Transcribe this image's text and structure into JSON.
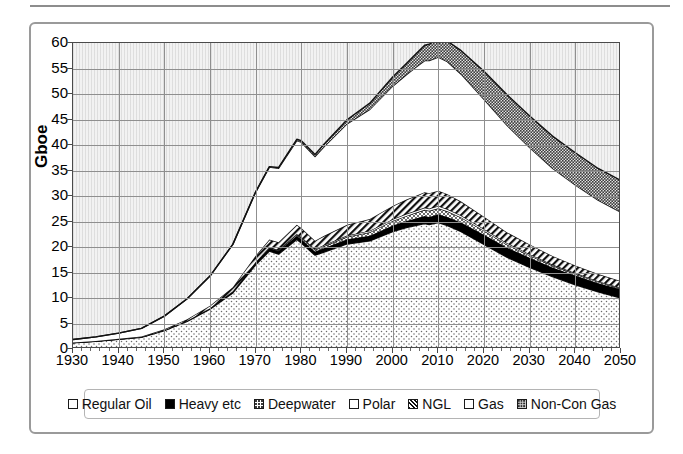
{
  "chart_data": {
    "type": "area",
    "title": "",
    "subtitle": "",
    "xlabel": "",
    "ylabel": "Gboe",
    "xlim": [
      1930,
      2050
    ],
    "ylim": [
      0,
      60
    ],
    "ytick_values": [
      0,
      5,
      10,
      15,
      20,
      25,
      30,
      35,
      40,
      45,
      50,
      55,
      60
    ],
    "xtick_values": [
      1930,
      1940,
      1950,
      1960,
      1970,
      1980,
      1990,
      2000,
      2010,
      2020,
      2030,
      2040,
      2050
    ],
    "grid": true,
    "stacked": true,
    "legend_position": "bottom",
    "x": [
      1930,
      1935,
      1940,
      1945,
      1950,
      1955,
      1960,
      1965,
      1970,
      1973,
      1975,
      1979,
      1980,
      1983,
      1985,
      1990,
      1995,
      2000,
      2003,
      2005,
      2007,
      2008,
      2010,
      2012,
      2015,
      2020,
      2025,
      2030,
      2035,
      2040,
      2045,
      2050
    ],
    "series": [
      {
        "name": "Regular Oil",
        "pattern": "light-stipple",
        "values": [
          1.2,
          1.5,
          1.9,
          2.3,
          3.6,
          5.4,
          7.8,
          11.0,
          16.5,
          19.2,
          18.6,
          21.5,
          20.8,
          18.4,
          19.0,
          20.6,
          21.2,
          23.0,
          23.8,
          24.2,
          24.6,
          24.4,
          24.8,
          24.2,
          23.0,
          20.5,
          18.0,
          16.0,
          14.2,
          12.6,
          11.2,
          10.0
        ]
      },
      {
        "name": "Heavy etc",
        "pattern": "solid-black",
        "values": [
          0.05,
          0.05,
          0.06,
          0.07,
          0.1,
          0.15,
          0.2,
          0.3,
          0.5,
          0.6,
          0.6,
          0.7,
          0.7,
          0.7,
          0.8,
          0.9,
          1.0,
          1.2,
          1.3,
          1.4,
          1.5,
          1.5,
          1.6,
          1.7,
          1.8,
          1.9,
          1.9,
          1.9,
          1.8,
          1.8,
          1.7,
          1.7
        ]
      },
      {
        "name": "Deepwater",
        "pattern": "medium-stipple",
        "values": [
          0.0,
          0.0,
          0.0,
          0.0,
          0.0,
          0.0,
          0.0,
          0.02,
          0.05,
          0.1,
          0.15,
          0.25,
          0.3,
          0.35,
          0.4,
          0.5,
          0.7,
          0.9,
          1.0,
          1.1,
          1.2,
          1.2,
          1.2,
          1.1,
          1.0,
          0.8,
          0.6,
          0.45,
          0.35,
          0.3,
          0.25,
          0.2
        ]
      },
      {
        "name": "Polar",
        "pattern": "white",
        "values": [
          0.0,
          0.0,
          0.0,
          0.0,
          0.0,
          0.0,
          0.0,
          0.0,
          0.02,
          0.05,
          0.08,
          0.12,
          0.15,
          0.18,
          0.2,
          0.25,
          0.3,
          0.35,
          0.4,
          0.4,
          0.45,
          0.45,
          0.45,
          0.45,
          0.4,
          0.35,
          0.3,
          0.25,
          0.2,
          0.18,
          0.15,
          0.12
        ]
      },
      {
        "name": "NGL",
        "pattern": "diagonal-hatch",
        "values": [
          0.02,
          0.03,
          0.05,
          0.08,
          0.15,
          0.3,
          0.5,
          0.8,
          1.2,
          1.5,
          1.5,
          1.8,
          1.8,
          1.6,
          1.8,
          2.1,
          2.3,
          2.6,
          2.8,
          2.9,
          3.0,
          3.0,
          3.0,
          2.9,
          2.7,
          2.4,
          2.1,
          1.9,
          1.7,
          1.5,
          1.4,
          1.3
        ]
      },
      {
        "name": "Gas",
        "pattern": "white",
        "values": [
          0.6,
          0.8,
          1.1,
          1.6,
          2.6,
          4.0,
          5.8,
          8.4,
          12.5,
          14.2,
          14.5,
          16.5,
          16.8,
          16.5,
          17.5,
          19.8,
          21.5,
          23.5,
          24.5,
          25.2,
          25.8,
          26.0,
          26.2,
          26.0,
          25.0,
          23.0,
          21.0,
          19.0,
          17.2,
          15.8,
          14.5,
          13.5
        ]
      },
      {
        "name": "Non-Con Gas",
        "pattern": "dense-stipple",
        "values": [
          0.0,
          0.0,
          0.0,
          0.0,
          0.0,
          0.0,
          0.0,
          0.0,
          0.05,
          0.1,
          0.15,
          0.25,
          0.3,
          0.4,
          0.5,
          0.8,
          1.2,
          1.8,
          2.2,
          2.6,
          3.0,
          3.2,
          3.6,
          4.0,
          4.6,
          5.5,
          6.0,
          6.2,
          6.3,
          6.3,
          6.2,
          6.2
        ]
      }
    ],
    "totals": [
      1.87,
      2.38,
      3.11,
      4.05,
      6.45,
      9.85,
      14.3,
      20.52,
      30.82,
      35.75,
      35.58,
      41.12,
      40.85,
      38.13,
      40.2,
      44.95,
      48.2,
      53.35,
      56.0,
      57.8,
      59.55,
      59.75,
      60.85,
      60.35,
      58.5,
      54.45,
      49.9,
      45.7,
      41.75,
      38.48,
      35.4,
      33.02
    ]
  },
  "axes": {
    "y_title": "Gboe",
    "y_ticks": [
      "60",
      "55",
      "50",
      "45",
      "40",
      "35",
      "30",
      "25",
      "20",
      "15",
      "10",
      "5",
      "0"
    ],
    "x_ticks": [
      "1930",
      "1940",
      "1950",
      "1960",
      "1970",
      "1980",
      "1990",
      "2000",
      "2010",
      "2020",
      "2030",
      "2040",
      "2050"
    ]
  },
  "legend": {
    "items": [
      {
        "label": "Regular Oil",
        "swatch": "sw-regular"
      },
      {
        "label": "Heavy etc",
        "swatch": "sw-heavy"
      },
      {
        "label": "Deepwater",
        "swatch": "sw-deep"
      },
      {
        "label": "Polar",
        "swatch": "sw-polar"
      },
      {
        "label": "NGL",
        "swatch": "sw-ngl"
      },
      {
        "label": "Gas",
        "swatch": "sw-gas"
      },
      {
        "label": "Non-Con Gas",
        "swatch": "sw-noncon"
      }
    ]
  },
  "colors": {
    "plot_background": "#f2f2f2",
    "gridline": "#8f8f8f",
    "axis_line": "#4a4a4a",
    "frame": "#9a9a9a",
    "series_outline": "#111111"
  }
}
